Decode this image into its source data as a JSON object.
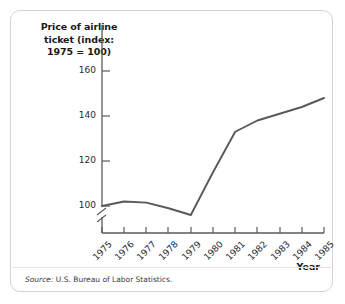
{
  "figure": {
    "title": "Price of airline ticket (index: 1975 = 100)",
    "title_line1": "Price of airline",
    "title_line2": "ticket (index:",
    "title_line3": "1975 = 100)",
    "source_keyword": "Source:",
    "source_text": " U.S. Bureau of Labor Statistics.",
    "x_axis_title": "Year",
    "line_color": "#595959",
    "axis_color": "#5a5a5a",
    "border_color": "#d4d4d4"
  },
  "chart_data": {
    "type": "line",
    "title": "Price of airline ticket (index: 1975 = 100)",
    "xlabel": "Year",
    "ylabel": "Price of airline ticket (index: 1975 = 100)",
    "x": [
      1975,
      1976,
      1977,
      1978,
      1979,
      1980,
      1981,
      1982,
      1983,
      1984,
      1985
    ],
    "categories": [
      "1975",
      "1976",
      "1977",
      "1978",
      "1979",
      "1980",
      "1981",
      "1982",
      "1983",
      "1984",
      "1985"
    ],
    "values": [
      100,
      102,
      101.5,
      99,
      96,
      115,
      133,
      138,
      141,
      144,
      148
    ],
    "series": [
      {
        "name": "Price of airline ticket (index: 1975 = 100)",
        "values": [
          100,
          102,
          101.5,
          99,
          96,
          115,
          133,
          138,
          141,
          144,
          148
        ]
      }
    ],
    "ytick_labels": [
      "100",
      "120",
      "140",
      "160"
    ],
    "yticks": [
      100,
      120,
      140,
      160
    ],
    "ylim": [
      92,
      165
    ],
    "xlim": [
      1975,
      1985
    ],
    "y_axis_break": true,
    "grid": false,
    "legend": false,
    "markers": false,
    "source": "Source: U.S. Bureau of Labor Statistics."
  }
}
